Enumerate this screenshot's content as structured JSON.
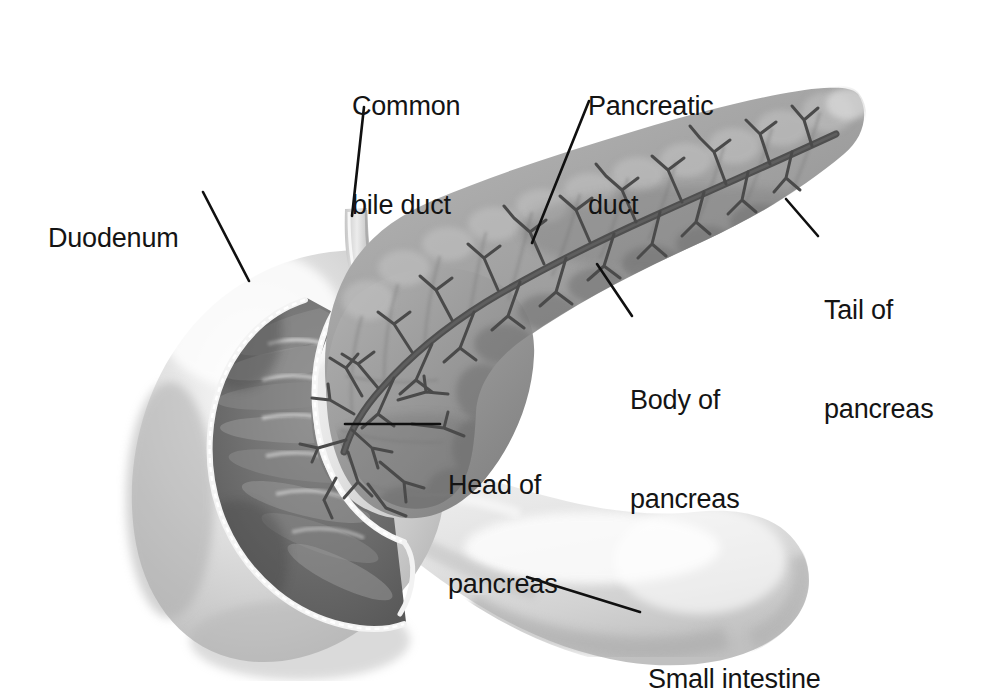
{
  "figure": {
    "kind": "anatomical-illustration",
    "background_color": "#ffffff",
    "label_color": "#141414",
    "leader_color": "#101010",
    "palette": {
      "pancreas_mid": "#9a9a9a",
      "pancreas_light": "#c2c2c2",
      "pancreas_dark": "#6f6f6f",
      "duct_tree": "#4c4c4c",
      "duodenum_wall": "#d5d5d5",
      "duodenum_lumen": "#6a6a6a",
      "duodenum_rim": "#f2f2f2",
      "small_intestine": "#dedede"
    }
  },
  "labels": [
    {
      "id": "common-bile-duct",
      "line1": "Common",
      "line2": "bile duct",
      "x": 352,
      "y": 24,
      "align": "left"
    },
    {
      "id": "pancreatic-duct",
      "line1": "Pancreatic",
      "line2": "duct",
      "x": 588,
      "y": 24,
      "align": "left"
    },
    {
      "id": "duodenum",
      "line1": "Duodenum",
      "line2": "",
      "x": 48,
      "y": 156,
      "align": "left"
    },
    {
      "id": "tail-of-pancreas",
      "line1": "Tail of",
      "line2": "pancreas",
      "x": 824,
      "y": 228,
      "align": "left"
    },
    {
      "id": "body-of-pancreas",
      "line1": "Body of",
      "line2": "pancreas",
      "x": 630,
      "y": 318,
      "align": "left"
    },
    {
      "id": "head-of-pancreas",
      "line1": "Head of",
      "line2": "pancreas",
      "x": 448,
      "y": 403,
      "align": "left"
    },
    {
      "id": "small-intestine",
      "line1": "Small intestine",
      "line2": "",
      "x": 648,
      "y": 597,
      "align": "left"
    }
  ],
  "leaders": [
    {
      "id": "leader-common-bile-duct",
      "x1": 364,
      "y1": 107,
      "x2": 352,
      "y2": 216
    },
    {
      "id": "leader-pancreatic-duct",
      "x1": 589,
      "y1": 101,
      "x2": 532,
      "y2": 243
    },
    {
      "id": "leader-duodenum",
      "x1": 203,
      "y1": 192,
      "x2": 249,
      "y2": 281
    },
    {
      "id": "leader-tail-of-pancreas",
      "x1": 786,
      "y1": 199,
      "x2": 818,
      "y2": 236
    },
    {
      "id": "leader-body-of-pancreas",
      "x1": 597,
      "y1": 264,
      "x2": 632,
      "y2": 316
    },
    {
      "id": "leader-head-of-pancreas",
      "x1": 345,
      "y1": 424,
      "x2": 440,
      "y2": 424
    },
    {
      "id": "leader-small-intestine",
      "x1": 527,
      "y1": 577,
      "x2": 640,
      "y2": 612
    }
  ],
  "parts": [
    {
      "id": "duodenum",
      "name": "Duodenum"
    },
    {
      "id": "pancreas-head",
      "name": "Head of pancreas"
    },
    {
      "id": "pancreas-body",
      "name": "Body of pancreas"
    },
    {
      "id": "pancreas-tail",
      "name": "Tail of pancreas"
    },
    {
      "id": "pancreatic-duct",
      "name": "Pancreatic duct"
    },
    {
      "id": "common-bile-duct",
      "name": "Common bile duct"
    },
    {
      "id": "small-intestine",
      "name": "Small intestine"
    }
  ]
}
